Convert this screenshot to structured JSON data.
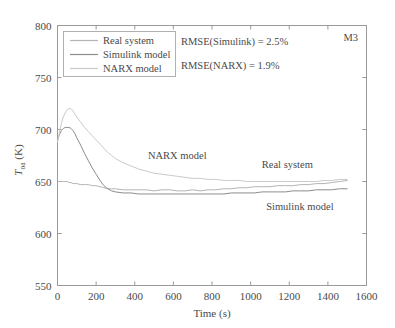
{
  "chart_data": {
    "type": "line",
    "title": "",
    "xlabel": "Time (s)",
    "ylabel": "T_oa (K)",
    "ylabel_main": "T",
    "ylabel_sub": "oa",
    "ylabel_unit": " (K)",
    "xlim": [
      0,
      1600
    ],
    "ylim": [
      550,
      800
    ],
    "xticks": [
      0,
      200,
      400,
      600,
      800,
      1000,
      1200,
      1400,
      1600
    ],
    "yticks": [
      550,
      600,
      650,
      700,
      750,
      800
    ],
    "xtick_labels": [
      "0",
      "200",
      "400",
      "600",
      "800",
      "1000",
      "1200",
      "1400",
      "1600"
    ],
    "ytick_labels": [
      "550",
      "600",
      "650",
      "700",
      "750",
      "800"
    ],
    "grid": false,
    "legend_position": "upper-left-inside",
    "corner_label": "M3",
    "annotations": [
      {
        "name": "rmse-simulink",
        "text": "RMSE(Simulink) = 2.5%"
      },
      {
        "name": "rmse-narx",
        "text": "RMSE(NARX) = 1.9%"
      }
    ],
    "inline_labels": [
      {
        "name": "narx-inline",
        "text": "NARX model",
        "x": 620,
        "y": 672
      },
      {
        "name": "real-system-inline",
        "text": "Real system",
        "x": 1190,
        "y": 663
      },
      {
        "name": "simulink-inline",
        "text": "Simulink model",
        "x": 1255,
        "y": 623
      }
    ],
    "series": [
      {
        "name": "Real system",
        "color": "#b4b4b4",
        "x": [
          0,
          10,
          20,
          30,
          40,
          50,
          60,
          70,
          80,
          90,
          100,
          120,
          140,
          160,
          180,
          200,
          220,
          240,
          260,
          280,
          300,
          340,
          380,
          420,
          460,
          500,
          540,
          580,
          620,
          660,
          700,
          740,
          780,
          820,
          860,
          900,
          940,
          980,
          1020,
          1060,
          1100,
          1140,
          1180,
          1220,
          1260,
          1300,
          1340,
          1380,
          1420,
          1460,
          1500
        ],
        "values": [
          650,
          650,
          650,
          650,
          650,
          650,
          649,
          649,
          648,
          648,
          648,
          647,
          647,
          647,
          646,
          646,
          645,
          644,
          643,
          643,
          643,
          642,
          642,
          642,
          642,
          641,
          642,
          642,
          641,
          641,
          642,
          641,
          642,
          642,
          643,
          643,
          644,
          644,
          645,
          645,
          645,
          646,
          646,
          646,
          647,
          647,
          648,
          648,
          649,
          650,
          651
        ]
      },
      {
        "name": "Simulink model",
        "color": "#8c8c8c",
        "x": [
          0,
          10,
          20,
          30,
          40,
          50,
          60,
          70,
          80,
          90,
          100,
          120,
          140,
          160,
          180,
          200,
          220,
          240,
          260,
          280,
          300,
          340,
          380,
          420,
          460,
          500,
          540,
          580,
          620,
          660,
          700,
          740,
          780,
          820,
          860,
          900,
          940,
          980,
          1020,
          1060,
          1100,
          1140,
          1180,
          1220,
          1260,
          1300,
          1340,
          1380,
          1420,
          1460,
          1500
        ],
        "values": [
          690,
          695,
          699,
          701,
          702,
          702,
          702,
          701,
          699,
          696,
          692,
          685,
          677,
          670,
          663,
          657,
          651,
          646,
          643,
          641,
          640,
          639,
          639,
          638,
          638,
          638,
          638,
          638,
          638,
          638,
          638,
          638,
          638,
          638,
          638,
          639,
          639,
          639,
          639,
          640,
          640,
          640,
          640,
          641,
          641,
          641,
          642,
          642,
          642,
          643,
          643
        ]
      },
      {
        "name": "NARX model",
        "color": "#cacaca",
        "x": [
          0,
          10,
          20,
          30,
          40,
          50,
          60,
          70,
          80,
          90,
          100,
          120,
          140,
          160,
          180,
          200,
          220,
          240,
          260,
          280,
          300,
          340,
          380,
          420,
          460,
          500,
          540,
          580,
          620,
          660,
          700,
          740,
          780,
          820,
          860,
          900,
          940,
          980,
          1020,
          1060,
          1100,
          1140,
          1180,
          1220,
          1260,
          1300,
          1340,
          1380,
          1420,
          1460,
          1500
        ],
        "values": [
          688,
          697,
          706,
          712,
          716,
          719,
          720,
          720,
          718,
          715,
          712,
          707,
          702,
          698,
          694,
          690,
          686,
          682,
          678,
          675,
          672,
          668,
          665,
          662,
          660,
          658,
          657,
          656,
          655,
          654,
          653,
          653,
          652,
          652,
          651,
          651,
          651,
          650,
          650,
          650,
          650,
          650,
          650,
          650,
          650,
          650,
          650,
          651,
          651,
          652,
          652
        ]
      }
    ]
  },
  "legend": {
    "entries": [
      {
        "label": "Real system",
        "color": "#b4b4b4"
      },
      {
        "label": "Simulink model",
        "color": "#8c8c8c"
      },
      {
        "label": "NARX model",
        "color": "#cacaca"
      }
    ]
  }
}
